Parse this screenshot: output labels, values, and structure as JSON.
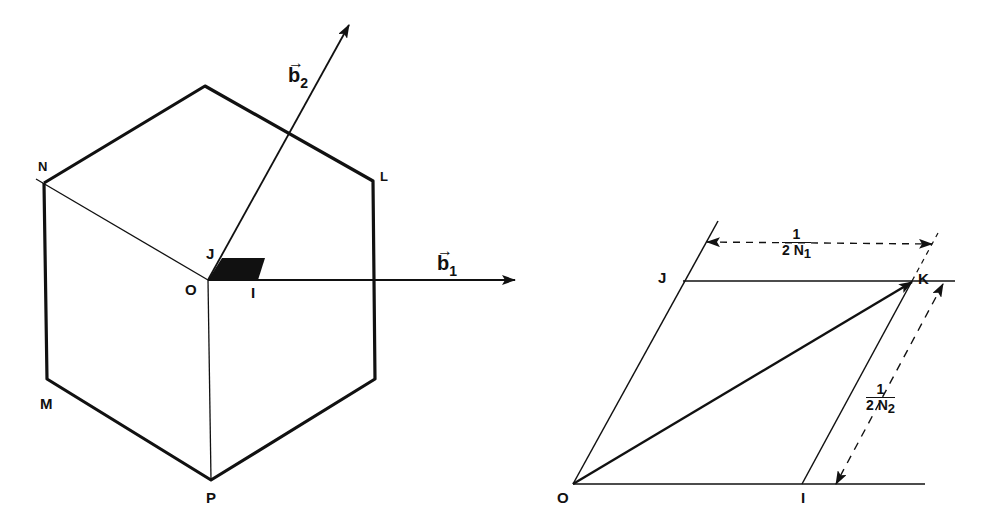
{
  "left_figure": {
    "labels": {
      "N": "N",
      "L": "L",
      "M": "M",
      "P": "P",
      "O": "O",
      "J": "J",
      "I": "I"
    },
    "vectors": {
      "b1": {
        "base": "b",
        "subscript": "1",
        "arrow": "→"
      },
      "b2": {
        "base": "b",
        "subscript": "2",
        "arrow": "→"
      }
    }
  },
  "right_figure": {
    "labels": {
      "O": "O",
      "I": "I",
      "J": "J",
      "K": "K"
    },
    "dimensions": {
      "horizontal": {
        "numerator": "1",
        "denominator_prefix": "2 N",
        "subscript": "1"
      },
      "slanted": {
        "numerator": "1",
        "denominator_prefix": "2 N",
        "subscript": "2"
      }
    }
  },
  "colors": {
    "ink": "#111111",
    "background": "#ffffff"
  }
}
